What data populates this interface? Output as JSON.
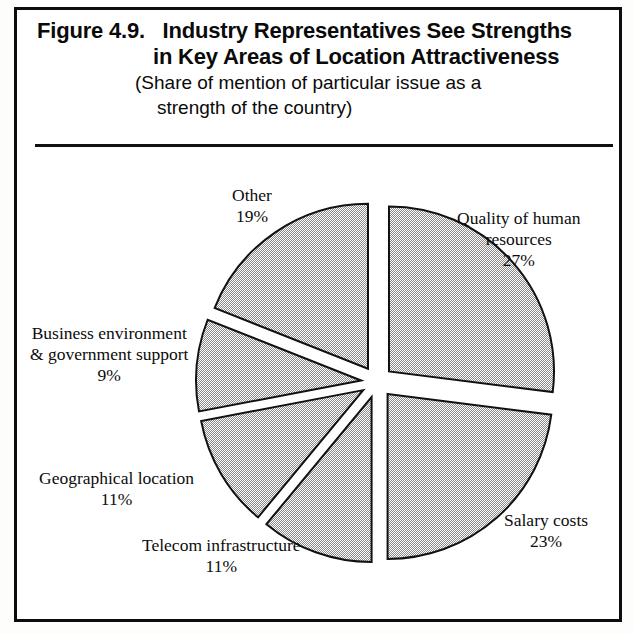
{
  "figure": {
    "number": "Figure 4.9.",
    "title_line_1": "Industry Representatives See Strengths",
    "title_line_2": "in Key Areas of Location Attractiveness",
    "subtitle_line_1": "(Share of mention of particular issue as a",
    "subtitle_line_2": "strength of the country)"
  },
  "labels": {
    "quality": {
      "name_line_1": "Quality of human",
      "name_line_2": "resources",
      "pct": "27%"
    },
    "salary": {
      "name_line_1": "Salary costs",
      "name_line_2": "",
      "pct": "23%"
    },
    "telecom": {
      "name_line_1": "Telecom infrastructure",
      "name_line_2": "",
      "pct": "11%"
    },
    "geographical": {
      "name_line_1": "Geographical location",
      "name_line_2": "",
      "pct": "11%"
    },
    "business": {
      "name_line_1": "Business environment",
      "name_line_2": "& government support",
      "pct": "9%"
    },
    "other": {
      "name_line_1": "Other",
      "name_line_2": "",
      "pct": "19%"
    }
  },
  "chart_data": {
    "type": "pie",
    "title": "Industry Representatives See Strengths in Key Areas of Location Attractiveness",
    "subtitle": "(Share of mention of particular issue as a strength of the country)",
    "exploded": true,
    "start_angle_deg": 0,
    "direction": "clockwise",
    "units": "percent",
    "total": 100,
    "categories": [
      "Quality of human resources",
      "Salary costs",
      "Telecom infrastructure",
      "Geographical location",
      "Business environment & government support",
      "Other"
    ],
    "values": [
      27,
      23,
      11,
      11,
      9,
      19
    ],
    "slices": [
      {
        "label": "Quality of human resources",
        "value": 27,
        "start": 0,
        "end": 97.2,
        "fill": "#b3b3b3"
      },
      {
        "label": "Salary costs",
        "value": 23,
        "start": 97.2,
        "end": 180.0,
        "fill": "#b3b3b3"
      },
      {
        "label": "Telecom infrastructure",
        "value": 11,
        "start": 180.0,
        "end": 219.6,
        "fill": "#b3b3b3"
      },
      {
        "label": "Geographical location",
        "value": 11,
        "start": 219.6,
        "end": 259.2,
        "fill": "#b3b3b3"
      },
      {
        "label": "Business environment & government support",
        "value": 9,
        "start": 259.2,
        "end": 291.6,
        "fill": "#b3b3b3"
      },
      {
        "label": "Other",
        "value": 19,
        "start": 291.6,
        "end": 360.0,
        "fill": "#b3b3b3"
      }
    ],
    "legend": "none",
    "colors": {
      "slice_fill": "#b3b3b3",
      "slice_stroke": "#111111",
      "frame": "#0d0d0d",
      "text": "#0c0c0c"
    }
  }
}
